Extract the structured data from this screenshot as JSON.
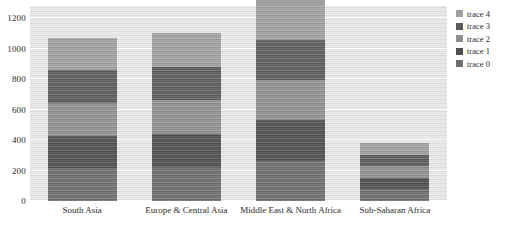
{
  "chart_data": {
    "type": "bar",
    "barmode": "stack",
    "title": "",
    "xlabel": "",
    "ylabel": "",
    "categories": [
      "South Asia",
      "Europe & Central Asia",
      "Middle East & North Africa",
      "Sub-Saharan Africa"
    ],
    "series": [
      {
        "name": "trace 0",
        "color": "#6e6e6e",
        "values": [
          215,
          220,
          265,
          76
        ]
      },
      {
        "name": "trace 1",
        "color": "#4f4f4f",
        "values": [
          214,
          220,
          264,
          76
        ]
      },
      {
        "name": "trace 2",
        "color": "#909090",
        "values": [
          214,
          220,
          264,
          76
        ]
      },
      {
        "name": "trace 3",
        "color": "#5c5c5c",
        "values": [
          214,
          220,
          264,
          76
        ]
      },
      {
        "name": "trace 4",
        "color": "#a0a0a0",
        "values": [
          214,
          220,
          264,
          76
        ]
      }
    ],
    "totals": [
      1071,
      1100,
      1321,
      380
    ],
    "ylim": [
      0,
      1280
    ],
    "yticks": [
      0,
      200,
      400,
      600,
      800,
      1000,
      1200
    ],
    "ytick_labels": [
      "0",
      "200",
      "400",
      "600",
      "800",
      "1000",
      "1200"
    ],
    "grid": true,
    "gridline_color": "#ffffff",
    "plot_background": "#e8e8e8",
    "paper_background": "#ffffff",
    "legend_position": "right",
    "legend_order": [
      "trace 4",
      "trace 3",
      "trace 2",
      "trace 1",
      "trace 0"
    ]
  },
  "legend": {
    "items": [
      {
        "label": "trace 4",
        "color": "#a0a0a0"
      },
      {
        "label": "trace 3",
        "color": "#5c5c5c"
      },
      {
        "label": "trace 2",
        "color": "#909090"
      },
      {
        "label": "trace 1",
        "color": "#4f4f4f"
      },
      {
        "label": "trace 0",
        "color": "#6e6e6e"
      }
    ]
  }
}
